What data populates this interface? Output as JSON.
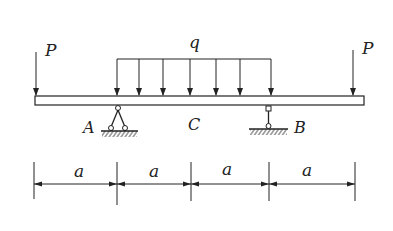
{
  "diagram": {
    "type": "beam",
    "loads": {
      "left_point": "P",
      "right_point": "P",
      "distributed": "q"
    },
    "points": {
      "support_A": "A",
      "support_B": "B",
      "midpoint": "C"
    },
    "dimensions": [
      "a",
      "a",
      "a",
      "a"
    ]
  }
}
